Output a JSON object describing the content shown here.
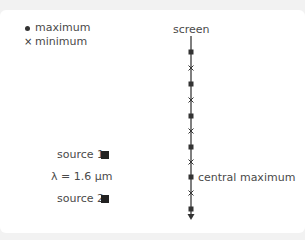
{
  "legend": {
    "items": [
      {
        "symbol": "dot",
        "label": "maximum"
      },
      {
        "symbol": "cross",
        "label": "minimum"
      }
    ]
  },
  "screen": {
    "label": "screen",
    "central_label": "central maximum",
    "line_color": "#555555",
    "marker_color": "#333333",
    "markers": [
      {
        "type": "dot",
        "y": 52
      },
      {
        "type": "cross",
        "y": 68
      },
      {
        "type": "dot",
        "y": 84
      },
      {
        "type": "cross",
        "y": 100
      },
      {
        "type": "dot",
        "y": 116
      },
      {
        "type": "cross",
        "y": 131
      },
      {
        "type": "dot",
        "y": 147
      },
      {
        "type": "cross",
        "y": 162
      },
      {
        "type": "dot",
        "y": 177
      },
      {
        "type": "cross",
        "y": 193
      },
      {
        "type": "dot",
        "y": 209
      }
    ]
  },
  "sources": {
    "source1_label": "source 1",
    "wavelength_label": "λ = 1.6 μm",
    "source2_label": "source 2"
  }
}
